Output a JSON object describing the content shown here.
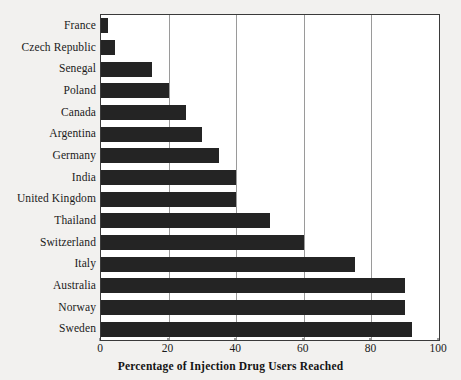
{
  "chart_data": {
    "type": "bar",
    "orientation": "horizontal",
    "title": "",
    "xlabel": "Percentage of Injection Drug Users Reached",
    "ylabel": "",
    "xlim": [
      0,
      100
    ],
    "xticks": [
      0,
      20,
      40,
      60,
      80,
      100
    ],
    "xtick_labels": [
      "0",
      "20",
      "40",
      "60",
      "80",
      "100"
    ],
    "grid": "vertical",
    "legend": "none",
    "bar_color": "#242424",
    "categories": [
      "France",
      "Czech Republic",
      "Senegal",
      "Poland",
      "Canada",
      "Argentina",
      "Germany",
      "India",
      "United Kingdom",
      "Thailand",
      "Switzerland",
      "Italy",
      "Australia",
      "Norway",
      "Sweden"
    ],
    "values": [
      2,
      4,
      15,
      20,
      25,
      30,
      35,
      40,
      40,
      50,
      60,
      75,
      90,
      90,
      92
    ]
  },
  "axis_title": {
    "text": "Percentage of Injection Drug Users Reached"
  }
}
